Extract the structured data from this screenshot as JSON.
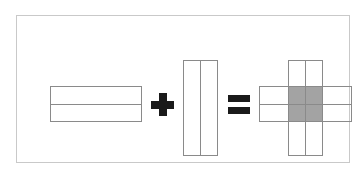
{
  "figure": {
    "caption": "",
    "background_color": "#ffffff",
    "frame_color": "#c9c9c9",
    "stroke_color": "#8a8a8a",
    "operator_color": "#1a1a1a",
    "shade_color": "#a3a3a3",
    "equation": "horizontal band + vertical band = cross with shaded intersection"
  },
  "operands": {
    "left": {
      "name": "horizontal-band",
      "rows": 2,
      "columns": 1,
      "fill": "white",
      "label": ""
    },
    "plus": {
      "name": "plus-operator",
      "symbol": "+"
    },
    "right": {
      "name": "vertical-band",
      "rows": 1,
      "columns": 2,
      "fill": "white",
      "label": ""
    },
    "equals": {
      "name": "equals-operator",
      "symbol": "="
    },
    "result": {
      "name": "cross-result",
      "rows": 2,
      "columns": 2,
      "intersection_shaded": true,
      "shade_color": "#a3a3a3",
      "label": ""
    }
  }
}
